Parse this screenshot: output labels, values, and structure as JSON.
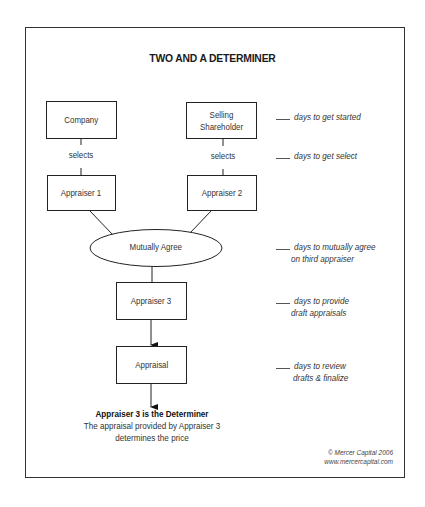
{
  "title": "TWO AND A DETERMINER",
  "nodes": {
    "company": "Company",
    "selling_shareholder_line1": "Selling",
    "selling_shareholder_line2": "Shareholder",
    "appraiser1": "Appraiser 1",
    "appraiser2": "Appraiser 2",
    "mutually_agree": "Mutually Agree",
    "appraiser3": "Appraiser 3",
    "appraisal": "Appraisal"
  },
  "edge_labels": {
    "company_selects": "selects",
    "shareholder_selects": "selects"
  },
  "timeline_notes": [
    {
      "line1": "days to get started",
      "line2": ""
    },
    {
      "line1": "days to get select",
      "line2": ""
    },
    {
      "line1": "days to mutually agree",
      "line2": "on third appraiser"
    },
    {
      "line1": "days to provide",
      "line2": "draft appraisals"
    },
    {
      "line1": "days to review",
      "line2": "drafts & finalize"
    }
  ],
  "conclusion": {
    "heading": "Appraiser 3 is the Determiner",
    "line1": "The appraisal provided by Appraiser 3",
    "line2": "determines the price"
  },
  "credit": {
    "copyright": "© Mercer Capital 2006",
    "website": "www.mercercapital.com"
  }
}
